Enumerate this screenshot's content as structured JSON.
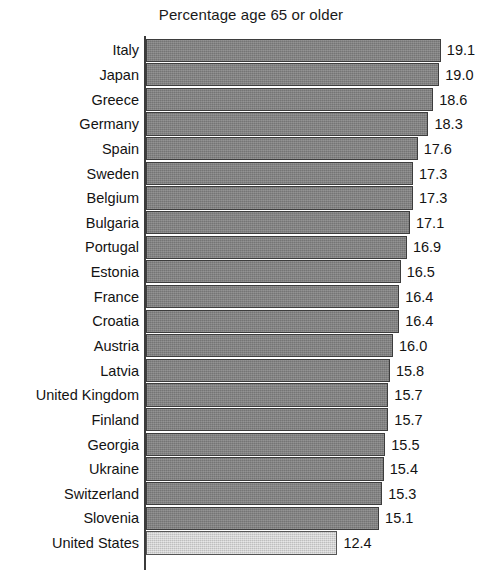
{
  "chart_data": {
    "type": "bar",
    "orientation": "horizontal",
    "title": "Percentage age 65 or older",
    "xlabel": "",
    "ylabel": "",
    "xlim": [
      0,
      20.6
    ],
    "grid": false,
    "legend": null,
    "value_labels": true,
    "categories": [
      "Italy",
      "Japan",
      "Greece",
      "Germany",
      "Spain",
      "Sweden",
      "Belgium",
      "Bulgaria",
      "Portugal",
      "Estonia",
      "France",
      "Croatia",
      "Austria",
      "Latvia",
      "United Kingdom",
      "Finland",
      "Georgia",
      "Ukraine",
      "Switzerland",
      "Slovenia",
      "United States"
    ],
    "values": [
      19.1,
      19.0,
      18.6,
      18.3,
      17.6,
      17.3,
      17.3,
      17.1,
      16.9,
      16.5,
      16.4,
      16.4,
      16.0,
      15.8,
      15.7,
      15.7,
      15.5,
      15.4,
      15.3,
      15.1,
      12.4
    ],
    "value_text": [
      "19.1",
      "19.0",
      "18.6",
      "18.3",
      "17.6",
      "17.3",
      "17.3",
      "17.1",
      "16.9",
      "16.5",
      "16.4",
      "16.4",
      "16.0",
      "15.8",
      "15.7",
      "15.7",
      "15.5",
      "15.4",
      "15.3",
      "15.1",
      "12.4"
    ],
    "highlight_category": "United States",
    "colors": {
      "bar": "#7d7d7d",
      "bar_highlight": "#c9c9c9",
      "bar_edge": "#3d3d3d",
      "axis": "#3b3b3b",
      "text": "#131313",
      "background": "#ffffff"
    }
  }
}
